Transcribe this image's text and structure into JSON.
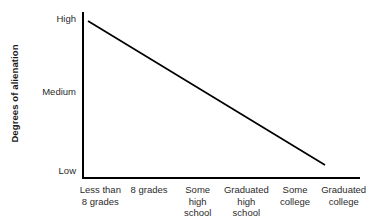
{
  "chart_data": {
    "type": "line",
    "title": "",
    "xlabel": "",
    "ylabel": "Degrees of alienation",
    "categories": [
      "Less than 8 grades",
      "8 grades",
      "Some high school",
      "Graduated high school",
      "Some college",
      "Graduated college"
    ],
    "category_lines": [
      [
        "Less than",
        "8 grades"
      ],
      [
        "8 grades"
      ],
      [
        "Some",
        "high",
        "school"
      ],
      [
        "Graduated",
        "high",
        "school"
      ],
      [
        "Some",
        "college"
      ],
      [
        "Graduated",
        "college"
      ]
    ],
    "ytick_labels": [
      "High",
      "Medium",
      "Low"
    ],
    "ylim": [
      "Low",
      "High"
    ],
    "values": [
      "High",
      "",
      "",
      "",
      "",
      "Low"
    ],
    "series": [
      {
        "name": "Alienation vs. education",
        "description": "Single straight declining line: alienation falls steadily from High at the lowest education level to Low at the highest",
        "points": [
          {
            "x": "Less than 8 grades",
            "y": "High"
          },
          {
            "x": "Graduated college",
            "y": "Low"
          }
        ]
      }
    ],
    "grid": false,
    "legend": null,
    "line_color": "#000000",
    "axis_color": "#000000"
  },
  "axes": {
    "y_title": "Degrees of alienation",
    "y_ticks": {
      "high": "High",
      "medium": "Medium",
      "low": "Low"
    }
  },
  "x_axis": {
    "categories": [
      {
        "lines": [
          "Less than",
          "8 grades"
        ]
      },
      {
        "lines": [
          "8 grades"
        ]
      },
      {
        "lines": [
          "Some",
          "high",
          "school"
        ]
      },
      {
        "lines": [
          "Graduated",
          "high",
          "school"
        ]
      },
      {
        "lines": [
          "Some",
          "college"
        ]
      },
      {
        "lines": [
          "Graduated",
          "college"
        ]
      }
    ]
  },
  "title": {
    "text": ""
  },
  "colors": {
    "line": "#000000",
    "axis": "#000000",
    "text": "#2b2b2b",
    "title_text": "#b9b9bd",
    "background": "#ffffff"
  }
}
